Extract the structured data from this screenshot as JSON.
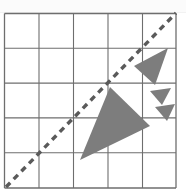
{
  "figure": {
    "background_color": "#ffffff",
    "top_strip_color": "#fbfbfb",
    "grid": {
      "name": "coordinate-grid",
      "columns": 5,
      "rows": 5,
      "x_start": 4.5,
      "y_start": 13.5,
      "cell_width": 34.5,
      "cell_height": 34.8,
      "line_color": "#6e6e6e",
      "line_width": 1.1,
      "border_color": "#6e6e6e",
      "border_width": 1.3,
      "vertical_lines": [
        4.5,
        39.0,
        73.5,
        108.0,
        142.5,
        176.0
      ],
      "horizontal_lines": [
        13.5,
        48.3,
        83.1,
        117.9,
        152.7,
        188.0
      ]
    },
    "dashed_line": {
      "name": "diagonal-dashed-line",
      "label": "y = x diagonal",
      "x1": 6,
      "y1": 187,
      "x2": 176,
      "y2": 13,
      "color": "#5a5a5a",
      "width": 3.4,
      "dash_pattern": "6 5"
    },
    "shapes": [
      {
        "name": "large-triangle",
        "label": "Large shaded triangle",
        "points": "110,87 80,160 150,126",
        "fill": "#7d7d7d",
        "stroke": "none"
      },
      {
        "name": "upper-triangle",
        "label": "Upper right shaded triangle",
        "points": "168,48 134,66 155,85",
        "fill": "#7d7d7d",
        "stroke": "none"
      },
      {
        "name": "small-triangle-upper",
        "label": "Small shaded triangle upper",
        "points": "171,88 150,91 162,105",
        "fill": "#7d7d7d",
        "stroke": "none"
      },
      {
        "name": "small-triangle-lower",
        "label": "Small shaded triangle lower",
        "points": "175,104 155,107 167,121",
        "fill": "#7d7d7d",
        "stroke": "none"
      }
    ]
  }
}
